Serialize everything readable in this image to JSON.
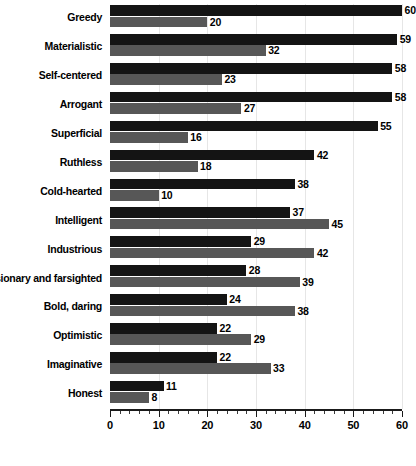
{
  "chart_data": {
    "type": "bar",
    "orientation": "horizontal",
    "title": "",
    "subtitle": "",
    "xlabel": "",
    "ylabel": "",
    "xlim": [
      0,
      60
    ],
    "xticks": [
      0,
      10,
      20,
      30,
      40,
      50,
      60
    ],
    "xtick_labels": [
      "0",
      "10",
      "20",
      "30",
      "40",
      "50",
      "60"
    ],
    "minor_tick_step": 2,
    "grid": true,
    "grid_axis": "x",
    "legend": "none",
    "categories": [
      "Greedy",
      "Materialistic",
      "Self-centered",
      "Arrogant",
      "Superficial",
      "Ruthless",
      "Cold-hearted",
      "Intelligent",
      "Industrious",
      "Visionary and farsighted",
      "Bold, daring",
      "Optimistic",
      "Imaginative",
      "Honest"
    ],
    "series": [
      {
        "name": "series-dark",
        "color": "#141414",
        "values": [
          60,
          59,
          58,
          58,
          55,
          42,
          38,
          37,
          29,
          28,
          24,
          22,
          22,
          11
        ]
      },
      {
        "name": "series-light",
        "color": "#575757",
        "values": [
          20,
          32,
          23,
          27,
          16,
          18,
          10,
          45,
          42,
          39,
          38,
          29,
          33,
          8
        ]
      }
    ]
  },
  "colors": {
    "dark_bar": "#141414",
    "light_bar": "#575757",
    "gridline": "#e6e6e6",
    "axis": "#1a1a1a",
    "text": "#000000",
    "background": "#ffffff"
  }
}
